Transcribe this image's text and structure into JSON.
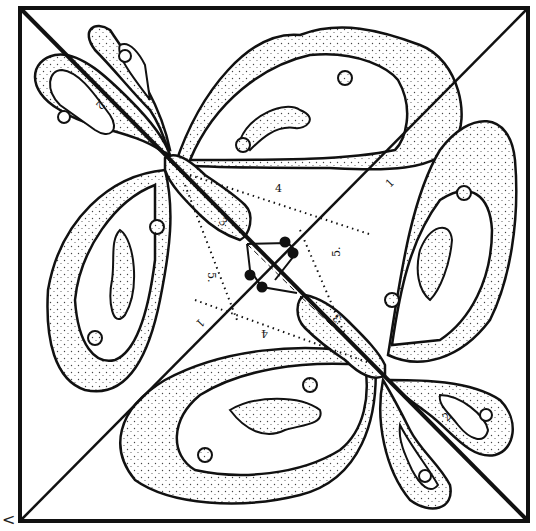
{
  "diagram": {
    "type": "quilt-block-pattern",
    "colors": {
      "line": "#111111",
      "background": "#ffffff",
      "stipple": "#444444"
    },
    "piece_labels": [
      {
        "id": "label-1-top",
        "text": "1",
        "x": 390,
        "y": 188,
        "rot": -45
      },
      {
        "id": "label-1-bottom",
        "text": "1",
        "x": 200,
        "y": 318,
        "rot": 135
      },
      {
        "id": "label-2-top",
        "text": "2",
        "x": 100,
        "y": 100,
        "rot": 135
      },
      {
        "id": "label-2-bottom",
        "text": "2",
        "x": 447,
        "y": 422,
        "rot": -45
      },
      {
        "id": "label-3-top",
        "text": "3",
        "x": 218,
        "y": 222,
        "rot": 45
      },
      {
        "id": "label-3-bottom",
        "text": "3",
        "x": 342,
        "y": 318,
        "rot": -135
      },
      {
        "id": "label-4-top",
        "text": "4",
        "x": 275,
        "y": 192,
        "rot": 0
      },
      {
        "id": "label-4-bottom",
        "text": "4",
        "x": 268,
        "y": 330,
        "rot": 180
      },
      {
        "id": "label-5-left",
        "text": "5.",
        "x": 208,
        "y": 272,
        "rot": 90
      },
      {
        "id": "label-5-right",
        "text": "5.",
        "x": 340,
        "y": 257,
        "rot": -90
      }
    ],
    "corner_mark": "<"
  }
}
